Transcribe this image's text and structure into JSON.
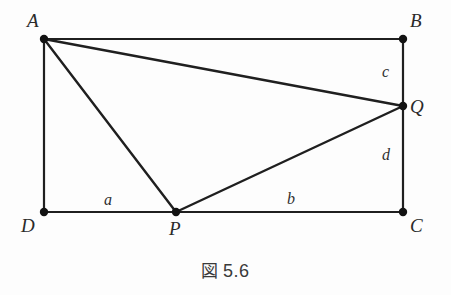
{
  "figure": {
    "caption_symbol": "図",
    "caption_number": "5.6",
    "caption_full": "図 5.6"
  },
  "diagram": {
    "type": "geometry-plane-figure",
    "shape": "rectangle-with-cevians",
    "stroke_color": "#1f1f1f",
    "background_color": "#fdfdfd",
    "point_color": "#121212",
    "vertices": [
      {
        "id": "A",
        "label": "A",
        "x": 44,
        "y": 39,
        "label_x": 27,
        "label_y": 11
      },
      {
        "id": "B",
        "label": "B",
        "x": 403,
        "y": 39,
        "label_x": 410,
        "label_y": 11
      },
      {
        "id": "Q",
        "label": "Q",
        "x": 403,
        "y": 106,
        "label_x": 410,
        "label_y": 97
      },
      {
        "id": "C",
        "label": "C",
        "x": 403,
        "y": 212,
        "label_x": 410,
        "label_y": 216
      },
      {
        "id": "P",
        "label": "P",
        "x": 176,
        "y": 212,
        "label_x": 169,
        "label_y": 219
      },
      {
        "id": "D",
        "label": "D",
        "x": 44,
        "y": 212,
        "label_x": 21,
        "label_y": 216
      }
    ],
    "edges": [
      {
        "id": "AB",
        "from": "A",
        "to": "B"
      },
      {
        "id": "BC",
        "from": "B",
        "to": "C"
      },
      {
        "id": "DC",
        "from": "D",
        "to": "C"
      },
      {
        "id": "AD",
        "from": "A",
        "to": "D"
      },
      {
        "id": "AQ",
        "from": "A",
        "to": "Q"
      },
      {
        "id": "AP",
        "from": "A",
        "to": "P"
      },
      {
        "id": "PQ",
        "from": "P",
        "to": "Q"
      }
    ],
    "segment_labels": [
      {
        "id": "a",
        "label": "a",
        "segment": "DP",
        "x": 104,
        "y": 192
      },
      {
        "id": "b",
        "label": "b",
        "segment": "PC",
        "x": 287,
        "y": 191
      },
      {
        "id": "c",
        "label": "c",
        "segment": "BQ",
        "x": 382,
        "y": 64
      },
      {
        "id": "d",
        "label": "d",
        "segment": "QC",
        "x": 382,
        "y": 147
      }
    ]
  }
}
